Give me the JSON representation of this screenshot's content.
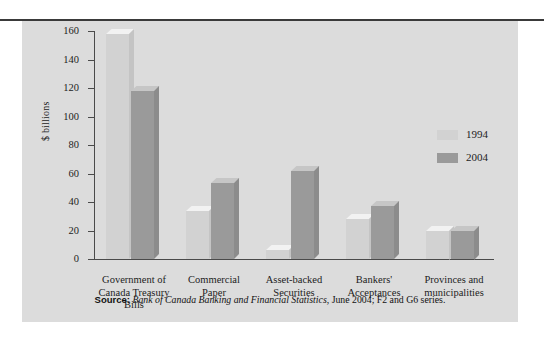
{
  "chart_data": {
    "type": "bar",
    "title": "",
    "xlabel": "",
    "ylabel": "$ billions",
    "ylim": [
      0,
      160
    ],
    "yticks": [
      0,
      20,
      40,
      60,
      80,
      100,
      120,
      140,
      160
    ],
    "grid": false,
    "legend_position": "right",
    "categories": [
      "Government of\nCanada Treasury\nBills",
      "Commercial\nPaper",
      "Asset-backed\nSecurities",
      "Bankers'\nAcceptances",
      "Provinces and\nmunicipalities"
    ],
    "category_lines": [
      [
        "Government of",
        "Canada Treasury",
        "Bills"
      ],
      [
        "Commercial",
        "Paper"
      ],
      [
        "Asset-backed",
        "Securities"
      ],
      [
        "Bankers'",
        "Acceptances"
      ],
      [
        "Provinces and",
        "municipalities"
      ]
    ],
    "series": [
      {
        "name": "1994",
        "color": "#d2d2d2",
        "values": [
          158,
          34,
          6,
          28,
          20
        ]
      },
      {
        "name": "2004",
        "color": "#9a9a9a",
        "values": [
          118,
          53,
          62,
          37,
          20
        ]
      }
    ],
    "annotations": []
  },
  "axis": {
    "y_title": "$ billions",
    "tick_labels": [
      "160",
      "140",
      "120",
      "100",
      "80",
      "60",
      "40",
      "20",
      "0"
    ]
  },
  "legend": {
    "items": [
      {
        "label": "1994",
        "color": "#d2d2d2"
      },
      {
        "label": "2004",
        "color": "#9a9a9a"
      }
    ]
  },
  "source": {
    "label": "Source:",
    "publication": "Bank of Canada Banking and Financial Statistics",
    "rest": ", June 2004; F2 and G6 series."
  },
  "colors": {
    "panel_background": "#dcdcdc",
    "page_background": "#ffffff",
    "axis": "#4a4a4a",
    "top_rule": "#3a3a3a",
    "series_1994": "#d2d2d2",
    "series_2004": "#9a9a9a",
    "text": "#1c1c1c"
  }
}
